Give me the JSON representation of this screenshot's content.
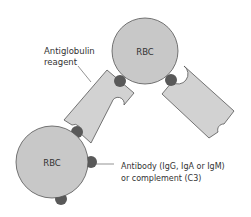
{
  "diagram": {
    "cells": [
      {
        "id": "rbc-top",
        "label": "RBC"
      },
      {
        "id": "rbc-bottom",
        "label": "RBC"
      }
    ],
    "labels": {
      "reagent_line1": "Antiglobulin",
      "reagent_line2": "reagent",
      "antibody_line1": "Antibody (IgG, IgA or IgM)",
      "antibody_line2": "or complement (C3)"
    },
    "colors": {
      "rbc_fill": "#c8c8c8",
      "reagent_fill": "#d2d2d2",
      "antibody_fill": "#595959",
      "stroke": "#555555"
    }
  }
}
